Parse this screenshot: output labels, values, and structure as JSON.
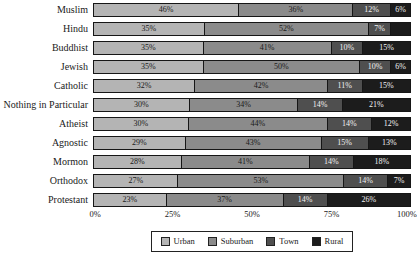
{
  "chart_data": {
    "type": "bar",
    "orientation": "horizontal",
    "stacked": true,
    "title": "",
    "xlabel": "",
    "ylabel": "",
    "xlim": [
      0,
      100
    ],
    "grid": false,
    "categories": [
      "Muslim",
      "Hindu",
      "Buddhist",
      "Jewish",
      "Catholic",
      "Nothing in Particular",
      "Atheist",
      "Agnostic",
      "Mormon",
      "Orthodox",
      "Protestant"
    ],
    "series": [
      {
        "name": "Urban",
        "color": "#b4b4b4",
        "values": [
          46,
          35,
          35,
          35,
          32,
          30,
          30,
          29,
          28,
          27,
          23
        ]
      },
      {
        "name": "Suburban",
        "color": "#8b8b8b",
        "values": [
          36,
          52,
          41,
          50,
          42,
          34,
          44,
          43,
          41,
          53,
          37
        ]
      },
      {
        "name": "Town",
        "color": "#4f4f4f",
        "values": [
          12,
          7,
          10,
          10,
          11,
          14,
          14,
          15,
          14,
          14,
          14
        ]
      },
      {
        "name": "Rural",
        "color": "#1c1c1c",
        "values": [
          6,
          6,
          15,
          6,
          15,
          21,
          12,
          13,
          18,
          7,
          26
        ]
      }
    ],
    "segment_labels": [
      [
        "46%",
        "36%",
        "12%",
        "6%"
      ],
      [
        "35%",
        "52%",
        "7%",
        ""
      ],
      [
        "35%",
        "41%",
        "10%",
        "15%"
      ],
      [
        "35%",
        "50%",
        "10%",
        "6%"
      ],
      [
        "32%",
        "42%",
        "11%",
        "15%"
      ],
      [
        "30%",
        "34%",
        "14%",
        "21%"
      ],
      [
        "30%",
        "44%",
        "14%",
        "12%"
      ],
      [
        "29%",
        "43%",
        "15%",
        "13%"
      ],
      [
        "28%",
        "41%",
        "14%",
        "18%"
      ],
      [
        "27%",
        "53%",
        "14%",
        "7%"
      ],
      [
        "23%",
        "37%",
        "14%",
        "26%"
      ]
    ],
    "x_ticks": [
      "0%",
      "25%",
      "50%",
      "75%",
      "100%"
    ],
    "legend": {
      "position": "bottom",
      "entries": [
        "Urban",
        "Suburban",
        "Town",
        "Rural"
      ]
    }
  },
  "colors": {
    "background": "#ffffff",
    "segment_border": "#161616",
    "label_on_light": "#1a1a1a",
    "label_on_dark": "#f2f2f2",
    "axis_text": "#1a1a1a"
  }
}
